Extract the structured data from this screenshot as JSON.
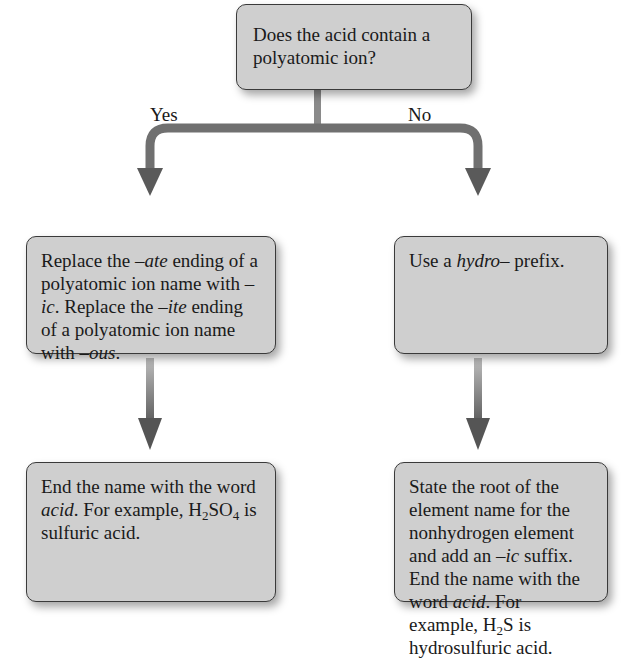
{
  "diagram": {
    "type": "flowchart",
    "question": {
      "text": "Does the acid contain a polyatomic ion?"
    },
    "branches": {
      "yes": {
        "label": "Yes",
        "step1": {
          "parts": [
            "Replace the ",
            "–ate",
            " ending of a polyatomic ion name with ",
            "–ic",
            ". Replace the ",
            "–ite",
            " ending of a polyatomic ion name with ",
            "–ous",
            "."
          ]
        },
        "step2": {
          "parts": [
            "End the name with the word ",
            "acid",
            ". For example, "
          ],
          "formula": {
            "h": "H",
            "h_sub": "2",
            "rest": "SO",
            "rest_sub": "4"
          },
          "tail": " is sulfuric acid."
        }
      },
      "no": {
        "label": "No",
        "step1": {
          "parts": [
            "Use a ",
            "hydro",
            "– prefix."
          ]
        },
        "step2": {
          "parts": [
            "State the root of the element name for the nonhydrogen element and add an ",
            "–ic",
            " suffix. End the name with the word ",
            "acid",
            ". For example, "
          ],
          "formula": {
            "h": "H",
            "h_sub": "2",
            "rest": "S"
          },
          "tail": " is hydrosulfuric acid."
        }
      }
    },
    "colors": {
      "box_fill": "#cfcfcf",
      "box_border": "#3a3a3a",
      "arrow": "#6e6e6e",
      "background": "#ffffff"
    }
  }
}
